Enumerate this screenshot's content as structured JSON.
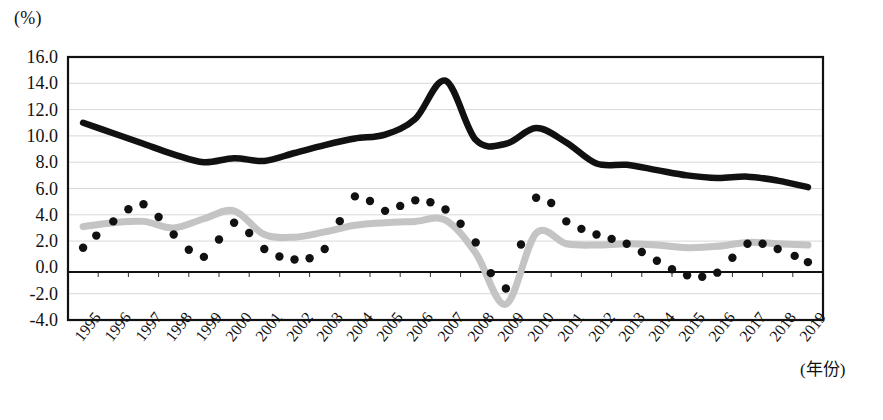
{
  "axes": {
    "y_unit": "(%)",
    "x_unit": "(年份)",
    "y_ticks": [
      "16.0",
      "14.0",
      "12.0",
      "10.0",
      "8.0",
      "6.0",
      "4.0",
      "2.0",
      "0.0",
      "-2.0",
      "-4.0"
    ],
    "x_ticks": [
      "1995",
      "1996",
      "1997",
      "1998",
      "1999",
      "2000",
      "2001",
      "2002",
      "2003",
      "2004",
      "2005",
      "2006",
      "2007",
      "2008",
      "2009",
      "2010",
      "2011",
      "2012",
      "2013",
      "2014",
      "2015",
      "2016",
      "2017",
      "2018",
      "2019"
    ]
  },
  "colors": {
    "series_black": "#111111",
    "series_gray": "#c4c4c4",
    "series_dots": "#111111",
    "grid": "#d8d8d8",
    "frame": "#111111"
  },
  "chart_data": {
    "type": "line",
    "title": "",
    "subtitle": "",
    "xlabel": "(年份)",
    "ylabel": "(%)",
    "ylim": [
      -4.0,
      16.0
    ],
    "yticks": [
      16.0,
      14.0,
      12.0,
      10.0,
      8.0,
      6.0,
      4.0,
      2.0,
      0.0,
      -2.0,
      -4.0
    ],
    "grid": true,
    "legend": "none",
    "x": [
      1995,
      1996,
      1997,
      1998,
      1999,
      2000,
      2001,
      2002,
      2003,
      2004,
      2005,
      2006,
      2007,
      2008,
      2009,
      2010,
      2011,
      2012,
      2013,
      2014,
      2015,
      2016,
      2017,
      2018,
      2019
    ],
    "series": [
      {
        "name": "black-solid-line",
        "style": "thick-solid-black",
        "values": [
          11.0,
          10.2,
          9.4,
          8.6,
          8.0,
          8.3,
          8.1,
          8.7,
          9.3,
          9.8,
          10.1,
          11.3,
          14.2,
          9.7,
          9.4,
          10.6,
          9.5,
          7.9,
          7.8,
          7.4,
          7.0,
          6.8,
          6.9,
          6.6,
          6.1
        ],
        "note": "peaks at 14.2 in 2007, secondary peak 10.6 in 2010, declining to ~6.1 by 2019"
      },
      {
        "name": "gray-solid-line",
        "style": "thick-solid-gray",
        "values": [
          3.1,
          3.4,
          3.5,
          3.0,
          3.7,
          4.3,
          2.5,
          2.3,
          2.7,
          3.2,
          3.4,
          3.5,
          3.6,
          1.1,
          -2.8,
          2.6,
          1.8,
          1.7,
          1.8,
          1.7,
          1.5,
          1.6,
          1.9,
          1.8,
          1.7
        ],
        "note": "trough of -2.8 in 2009, peak 4.3 in 2000"
      },
      {
        "name": "black-dotted-series",
        "style": "dotted-black-markers",
        "values": [
          1.5,
          3.5,
          4.8,
          2.5,
          0.8,
          3.4,
          1.4,
          0.6,
          1.4,
          5.4,
          4.3,
          5.1,
          4.4,
          1.9,
          -1.6,
          5.3,
          3.5,
          2.5,
          1.8,
          0.5,
          -0.6,
          -0.4,
          1.8,
          1.4,
          0.4
        ],
        "note": "plotted at semi-annual resolution; trough -1.6 around 2009, peaks near 5.4 (2004) 5.3 (2010) 6.0 spike (2004 early)"
      }
    ]
  }
}
